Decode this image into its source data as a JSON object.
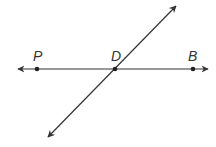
{
  "diagram": {
    "points": [
      {
        "label": "P",
        "x": 37,
        "y": 69
      },
      {
        "label": "D",
        "x": 115,
        "y": 69
      },
      {
        "label": "B",
        "x": 193,
        "y": 69
      }
    ],
    "lines": [
      {
        "name": "line-PB",
        "from": [
          18,
          69
        ],
        "to": [
          208,
          69
        ],
        "arrows": "both"
      },
      {
        "name": "transversal-through-D",
        "from": [
          48,
          137
        ],
        "to": [
          176,
          6
        ],
        "arrows": "both"
      }
    ],
    "colors": {
      "stroke": "#333333",
      "background": "#ffffff"
    }
  }
}
